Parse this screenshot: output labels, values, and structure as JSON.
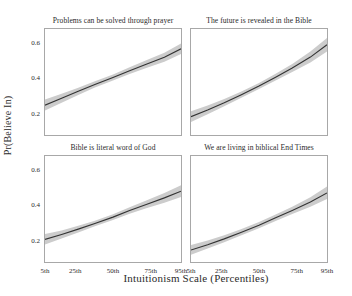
{
  "chart_data": {
    "type": "line",
    "title": "",
    "xlabel": "Intuitionism Scale (Percentiles)",
    "ylabel": "Pr(Believe In)",
    "grid": false,
    "legend": "none",
    "layout": "2x2 small multiples",
    "x": [
      5,
      25,
      50,
      75,
      95
    ],
    "xtick_labels": [
      "5th",
      "25th",
      "50th",
      "75th",
      "95th"
    ],
    "ytick_labels": [
      "0.2",
      "0.4",
      "0.6"
    ],
    "ytick_values": [
      0.2,
      0.4,
      0.6
    ],
    "xlim": [
      5,
      95
    ],
    "ylim": [
      0.08,
      0.68
    ],
    "line_color": "#333333",
    "band_color": "#cccccc",
    "panel_border_color": "#a8a8a8",
    "panels": [
      {
        "title": "Problems can be solved through prayer",
        "x": [
          5,
          16,
          27,
          38,
          50,
          61,
          72,
          84,
          95
        ],
        "fit": [
          0.249,
          0.288,
          0.327,
          0.366,
          0.406,
          0.444,
          0.481,
          0.52,
          0.568
        ],
        "lower": [
          0.218,
          0.263,
          0.307,
          0.349,
          0.389,
          0.425,
          0.459,
          0.495,
          0.538
        ],
        "upper": [
          0.281,
          0.314,
          0.348,
          0.384,
          0.423,
          0.463,
          0.503,
          0.546,
          0.598
        ]
      },
      {
        "title": "The future is revealed in the Bible",
        "x": [
          5,
          16,
          27,
          38,
          50,
          61,
          72,
          84,
          95
        ],
        "fit": [
          0.184,
          0.222,
          0.263,
          0.307,
          0.357,
          0.407,
          0.459,
          0.521,
          0.591
        ],
        "lower": [
          0.154,
          0.197,
          0.243,
          0.29,
          0.34,
          0.388,
          0.436,
          0.49,
          0.552
        ],
        "upper": [
          0.214,
          0.247,
          0.284,
          0.325,
          0.375,
          0.427,
          0.482,
          0.552,
          0.629
        ]
      },
      {
        "title": "Bible is literal word of God",
        "x": [
          5,
          16,
          27,
          38,
          50,
          61,
          72,
          84,
          95
        ],
        "fit": [
          0.208,
          0.236,
          0.266,
          0.298,
          0.334,
          0.371,
          0.406,
          0.443,
          0.481
        ],
        "lower": [
          0.179,
          0.213,
          0.247,
          0.282,
          0.318,
          0.353,
          0.384,
          0.416,
          0.448
        ],
        "upper": [
          0.238,
          0.259,
          0.285,
          0.314,
          0.35,
          0.39,
          0.428,
          0.471,
          0.515
        ]
      },
      {
        "title": "We are living in biblical End Times",
        "x": [
          5,
          16,
          27,
          38,
          50,
          61,
          72,
          84,
          95
        ],
        "fit": [
          0.148,
          0.178,
          0.211,
          0.247,
          0.288,
          0.33,
          0.372,
          0.42,
          0.471
        ],
        "lower": [
          0.121,
          0.156,
          0.192,
          0.23,
          0.271,
          0.312,
          0.351,
          0.393,
          0.436
        ],
        "upper": [
          0.176,
          0.201,
          0.231,
          0.265,
          0.306,
          0.349,
          0.393,
          0.447,
          0.507
        ]
      }
    ]
  }
}
